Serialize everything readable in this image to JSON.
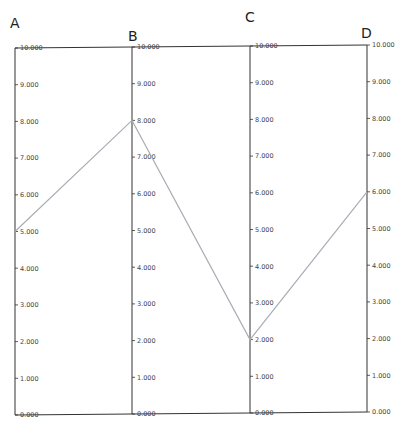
{
  "chart_data": {
    "type": "parallel_coordinates",
    "title": "",
    "axes": [
      {
        "name": "A",
        "range": [
          0,
          10
        ],
        "ticks": [
          "0.000",
          "1.000",
          "2.000",
          "3.000",
          "4.000",
          "5.000",
          "6.000",
          "7.000",
          "8.000",
          "9.000",
          "10.000"
        ]
      },
      {
        "name": "B",
        "range": [
          0,
          10
        ],
        "ticks": [
          "0.000",
          "1.000",
          "2.000",
          "3.000",
          "4.000",
          "5.000",
          "6.000",
          "7.000",
          "8.000",
          "9.000",
          "10.000"
        ]
      },
      {
        "name": "C",
        "range": [
          0,
          10
        ],
        "ticks": [
          "0.000",
          "1.000",
          "2.000",
          "3.000",
          "4.000",
          "5.000",
          "6.000",
          "7.000",
          "8.000",
          "9.000",
          "10.000"
        ]
      },
      {
        "name": "D",
        "range": [
          0,
          10
        ],
        "ticks": [
          "0.000",
          "1.000",
          "2.000",
          "3.000",
          "4.000",
          "5.000",
          "6.000",
          "7.000",
          "8.000",
          "9.000",
          "10.000"
        ]
      }
    ],
    "categories": [
      "A",
      "B",
      "C",
      "D"
    ],
    "series": [
      {
        "name": "record-1",
        "values": [
          5,
          8,
          2,
          6
        ],
        "color": "#a9adb5"
      }
    ],
    "grid": false,
    "legend": "none"
  },
  "colors": {
    "axis": "#333333",
    "line": "#a9adb5"
  }
}
